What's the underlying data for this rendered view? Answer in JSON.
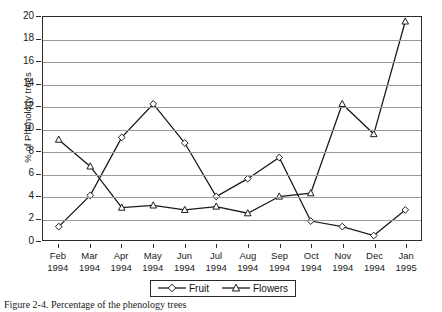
{
  "figure": {
    "caption": "Figure 2-4. Percentage of the phenology trees"
  },
  "axes": {
    "ylabel": "% of Phenology trees",
    "yticks": [
      0,
      2,
      4,
      6,
      8,
      10,
      12,
      14,
      16,
      18,
      20
    ]
  },
  "legend": {
    "entries": [
      {
        "label": "Fruit",
        "marker": "diamond-marker"
      },
      {
        "label": "Flowers",
        "marker": "triangle-marker"
      }
    ]
  },
  "chart_data": {
    "type": "line",
    "title": "",
    "xlabel": "",
    "ylabel": "% of Phenology trees",
    "ylim": [
      0,
      20
    ],
    "ytick_step": 2,
    "grid": "horizontal",
    "legend_position": "bottom-center",
    "categories": [
      "Feb 1994",
      "Mar 1994",
      "Apr 1994",
      "May 1994",
      "Jun 1994",
      "Jul 1994",
      "Aug 1994",
      "Sep 1994",
      "Oct 1994",
      "Nov 1994",
      "Dec 1994",
      "Jan 1995"
    ],
    "category_months": [
      "Feb",
      "Mar",
      "Apr",
      "May",
      "Jun",
      "Jul",
      "Aug",
      "Sep",
      "Oct",
      "Nov",
      "Dec",
      "Jan"
    ],
    "category_years": [
      "1994",
      "1994",
      "1994",
      "1994",
      "1994",
      "1994",
      "1994",
      "1994",
      "1994",
      "1994",
      "1994",
      "1995"
    ],
    "series": [
      {
        "name": "Fruit",
        "marker": "diamond",
        "values": [
          1.2,
          4.0,
          9.2,
          12.2,
          8.7,
          3.9,
          5.5,
          7.4,
          1.7,
          1.2,
          0.4,
          2.7
        ]
      },
      {
        "name": "Flowers",
        "marker": "triangle",
        "values": [
          9.0,
          6.6,
          2.9,
          3.1,
          2.7,
          3.0,
          2.4,
          3.9,
          4.2,
          12.2,
          9.5,
          19.6
        ]
      }
    ]
  },
  "colors": {
    "line": "#1a1a1a",
    "grid": "#9a9a9a",
    "axis": "#2b2b2b",
    "background": "#ffffff"
  }
}
